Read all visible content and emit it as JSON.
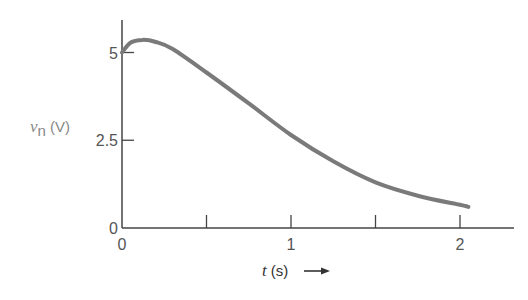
{
  "chart_data": {
    "type": "line",
    "title": "",
    "xlabel": "t (s)",
    "xlabel_var": "t",
    "xlabel_unit": "(s)",
    "xlabel_arrow": "⟶",
    "ylabel": "v_n (V)",
    "ylabel_var": "v",
    "ylabel_sub": "n",
    "ylabel_unit": "(V)",
    "xlim": [
      0,
      2.3
    ],
    "ylim": [
      0,
      6.2
    ],
    "grid": false,
    "legend": null,
    "x_ticks": [
      0,
      0.5,
      1,
      1.5,
      2
    ],
    "x_tick_labels": [
      "0",
      "",
      "1",
      "",
      "2"
    ],
    "y_ticks": [
      0,
      2.5,
      5
    ],
    "y_tick_labels": [
      "0",
      "2.5",
      "5"
    ],
    "series": [
      {
        "name": "v_n(t)",
        "color": "#7a7a7a",
        "x": [
          0,
          0.05,
          0.12,
          0.2,
          0.3,
          0.5,
          0.75,
          1.0,
          1.25,
          1.5,
          1.75,
          2.0,
          2.05
        ],
        "values": [
          5.0,
          5.28,
          5.36,
          5.3,
          5.1,
          4.43,
          3.55,
          2.65,
          1.9,
          1.3,
          0.92,
          0.66,
          0.6
        ]
      }
    ]
  },
  "colors": {
    "axis": "#444444",
    "curve": "#7a7a7a"
  }
}
